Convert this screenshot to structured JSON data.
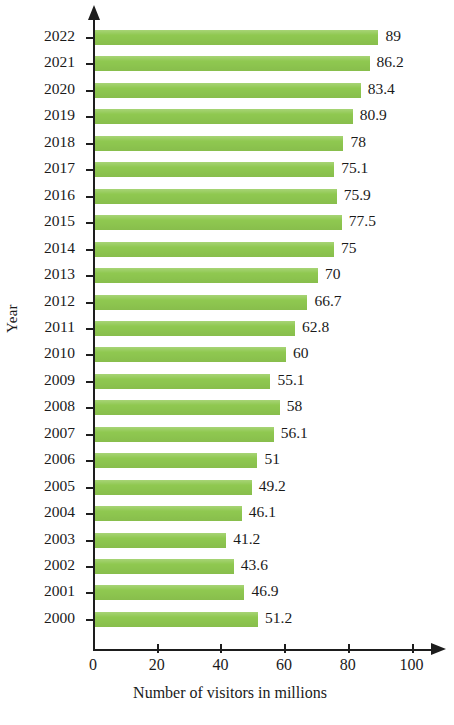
{
  "chart_data": {
    "type": "bar",
    "orientation": "horizontal",
    "title": "",
    "xlabel": "Number of visitors in millions",
    "ylabel": "Year",
    "xlim": [
      0,
      107
    ],
    "xticks": [
      0,
      20,
      40,
      60,
      80,
      100
    ],
    "xtick_labels": [
      "0",
      "20",
      "40",
      "60",
      "80",
      "100"
    ],
    "grid": false,
    "legend": null,
    "bar_color": "#8fc850",
    "axis_color": "#1d1d1d",
    "categories": [
      "2022",
      "2021",
      "2020",
      "2019",
      "2018",
      "2017",
      "2016",
      "2015",
      "2014",
      "2013",
      "2012",
      "2011",
      "2010",
      "2009",
      "2008",
      "2007",
      "2006",
      "2005",
      "2004",
      "2003",
      "2002",
      "2001",
      "2000"
    ],
    "values": [
      89,
      86.2,
      83.4,
      80.9,
      78,
      75.1,
      75.9,
      77.5,
      75,
      70,
      66.7,
      62.8,
      60,
      55.1,
      58,
      56.1,
      51,
      49.2,
      46.1,
      41.2,
      43.6,
      46.9,
      51.2
    ],
    "value_labels": [
      "89",
      "86.2",
      "83.4",
      "80.9",
      "78",
      "75.1",
      "75.9",
      "77.5",
      "75",
      "70",
      "66.7",
      "62.8",
      "60",
      "55.1",
      "58",
      "56.1",
      "51",
      "49.2",
      "46.1",
      "41.2",
      "43.6",
      "46.9",
      "51.2"
    ]
  }
}
